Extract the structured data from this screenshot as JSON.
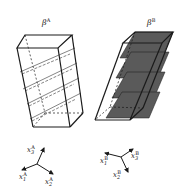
{
  "diagram": {
    "panels": [
      {
        "id": "A",
        "label": "β",
        "label_sup": "A",
        "planes": "hatched diagonal lines (4 inclined planes)",
        "axes": [
          {
            "label": "x",
            "sub": "3",
            "sup": "A"
          },
          {
            "label": "x",
            "sub": "1",
            "sup": "A"
          },
          {
            "label": "x",
            "sub": "2",
            "sup": "A"
          }
        ]
      },
      {
        "id": "B",
        "label": "β",
        "label_sup": "B",
        "planes": "shaded gray (4 inclined planes)",
        "axes": [
          {
            "label": "x",
            "sub": "1",
            "sup": "B"
          },
          {
            "label": "x",
            "sub": "3",
            "sup": "B"
          },
          {
            "label": "x",
            "sub": "2",
            "sup": "B"
          }
        ]
      }
    ],
    "colors": {
      "line": "#1a1a1a",
      "plane_fill": "#5a5a5a",
      "background": "#ffffff"
    }
  }
}
